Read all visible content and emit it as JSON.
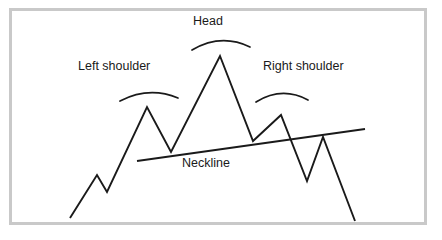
{
  "figure": {
    "background_color": "#ffffff",
    "frame_color": "#c9c9c9",
    "line_color": "#1a1a1a"
  },
  "labels": {
    "left_shoulder": "Left shoulder",
    "head": "Head",
    "right_shoulder": "Right shoulder",
    "neckline": "Neckline"
  },
  "chart_data": {
    "type": "line",
    "xlabel": "",
    "ylabel": "",
    "grid": false,
    "legend": "none",
    "xlim": [
      60,
      370
    ],
    "ylim": [
      225,
      45
    ],
    "series": [
      {
        "name": "price-path",
        "x": [
          70,
          97,
          107,
          147,
          171,
          220,
          253,
          281,
          307,
          323,
          355
        ],
        "y": [
          218,
          175,
          192,
          107,
          152,
          56,
          141,
          115,
          181,
          137,
          221
        ],
        "points": [
          {
            "name": "start",
            "x": 70,
            "y": 218
          },
          {
            "name": "minor-peak",
            "x": 97,
            "y": 175
          },
          {
            "name": "minor-trough",
            "x": 107,
            "y": 192
          },
          {
            "name": "left-shoulder-peak",
            "x": 147,
            "y": 107
          },
          {
            "name": "left-trough",
            "x": 171,
            "y": 152
          },
          {
            "name": "head-peak",
            "x": 220,
            "y": 56
          },
          {
            "name": "right-trough",
            "x": 253,
            "y": 141
          },
          {
            "name": "right-shoulder-peak",
            "x": 281,
            "y": 115
          },
          {
            "name": "breakdown-trough",
            "x": 307,
            "y": 181
          },
          {
            "name": "pullback-peak",
            "x": 323,
            "y": 137
          },
          {
            "name": "end",
            "x": 355,
            "y": 221
          }
        ]
      },
      {
        "name": "neckline",
        "x": [
          137,
          365
        ],
        "y": [
          161,
          129
        ]
      }
    ],
    "annotations": [
      {
        "name": "left-shoulder-arc",
        "path": "M 120 101 Q 149 86 178 98"
      },
      {
        "name": "head-arc",
        "path": "M 192 50 Q 221 33 250 47"
      },
      {
        "name": "right-shoulder-arc",
        "path": "M 256 102 Q 282 86 308 100"
      }
    ]
  }
}
